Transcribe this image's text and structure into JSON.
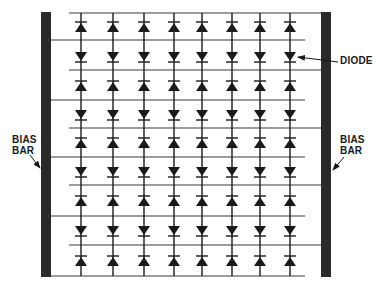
{
  "diagram": {
    "type": "diode-array-schematic",
    "colors": {
      "ink": "#1a1a1a",
      "bar": "#2a2a2a",
      "line": "#3a3a3a",
      "background": "#ffffff"
    },
    "bias_bars": [
      {
        "id": "left",
        "x": 41,
        "y": 12,
        "width": 10,
        "height": 265
      },
      {
        "id": "right",
        "x": 321,
        "y": 12,
        "width": 10,
        "height": 265
      }
    ],
    "columns_x": [
      81,
      113,
      144,
      174,
      202,
      232,
      260,
      290
    ],
    "column_top": 13,
    "column_bottom": 276,
    "horizontal_lines": [
      {
        "y": 13,
        "x1": 69,
        "x2": 321,
        "connects": "right"
      },
      {
        "y": 40,
        "x1": 51,
        "x2": 305,
        "connects": "left"
      },
      {
        "y": 70,
        "x1": 69,
        "x2": 321,
        "connects": "right"
      },
      {
        "y": 100,
        "x1": 51,
        "x2": 305,
        "connects": "left"
      },
      {
        "y": 128,
        "x1": 69,
        "x2": 321,
        "connects": "right"
      },
      {
        "y": 157,
        "x1": 51,
        "x2": 305,
        "connects": "left"
      },
      {
        "y": 185,
        "x1": 69,
        "x2": 321,
        "connects": "right"
      },
      {
        "y": 216,
        "x1": 51,
        "x2": 305,
        "connects": "left"
      },
      {
        "y": 245,
        "x1": 69,
        "x2": 321,
        "connects": "right"
      },
      {
        "y": 276,
        "x1": 51,
        "x2": 305,
        "connects": "left"
      }
    ],
    "diode_rows": [
      {
        "y": 27,
        "direction": "up"
      },
      {
        "y": 57,
        "direction": "down"
      },
      {
        "y": 86,
        "direction": "up"
      },
      {
        "y": 115,
        "direction": "down"
      },
      {
        "y": 143,
        "direction": "up"
      },
      {
        "y": 172,
        "direction": "down"
      },
      {
        "y": 201,
        "direction": "up"
      },
      {
        "y": 231,
        "direction": "down"
      },
      {
        "y": 261,
        "direction": "up"
      }
    ],
    "labels": {
      "diode": {
        "text": "DIODE",
        "x": 340,
        "y": 55
      },
      "left_bias": {
        "line1": "BIAS",
        "line2": "BAR",
        "x": 12,
        "y": 134
      },
      "right_bias": {
        "line1": "BIAS",
        "line2": "BAR",
        "x": 340,
        "y": 134
      }
    },
    "arrows": [
      {
        "name": "diode-pointer",
        "x1": 338,
        "y1": 62,
        "x2": 298,
        "y2": 57
      },
      {
        "name": "left-bias-pointer",
        "x1": 30,
        "y1": 155,
        "x2": 40,
        "y2": 168
      },
      {
        "name": "right-bias-pointer",
        "x1": 344,
        "y1": 157,
        "x2": 333,
        "y2": 170
      }
    ]
  }
}
